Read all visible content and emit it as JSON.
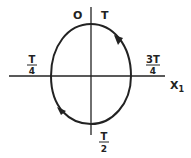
{
  "diagram": {
    "type": "phase-orbit",
    "axis_label_x": "X",
    "axis_label_x_subscript": "1",
    "labels": {
      "top_left": "O",
      "top_right": "T",
      "left": {
        "numerator": "T",
        "denominator": "4"
      },
      "right": {
        "numerator": "3T",
        "denominator": "4"
      },
      "bottom": {
        "numerator": "T",
        "denominator": "2"
      }
    },
    "arrows": [
      "arrow-upper-right-counterclockwise",
      "arrow-lower-left-counterclockwise"
    ],
    "colors": {
      "stroke": "#222222",
      "background": "#ffffff"
    }
  }
}
